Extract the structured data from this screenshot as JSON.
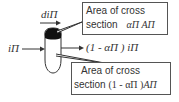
{
  "diagram": {
    "labels": {
      "incoming_current": "iΠ",
      "differential_current": "diΠ",
      "outgoing_current": "(1 - αΠ ) iΠ"
    },
    "callouts": [
      {
        "line1": "Area of cross",
        "line2_prefix": "section",
        "line2_math": "αΠ AΠ"
      },
      {
        "line1": "Area of cross",
        "line2_prefix": "section",
        "line2_math_a": "(1 - αΠ )",
        "line2_math_b": "AΠ"
      }
    ],
    "colors": {
      "stroke": "#333333",
      "fill_dark": "#111111",
      "box_border": "#555555"
    }
  }
}
